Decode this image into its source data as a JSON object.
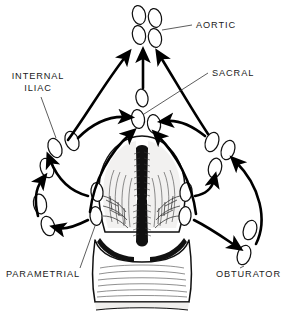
{
  "figure": {
    "background_color": "#ffffff",
    "ink_color": "#111111",
    "width": 284,
    "height": 318
  },
  "labels": [
    {
      "id": "aortic",
      "text": "AORTIC",
      "x": 196,
      "y": 28,
      "anchor": "start"
    },
    {
      "id": "sacral",
      "text": "SACRAL",
      "x": 212,
      "y": 76,
      "anchor": "start"
    },
    {
      "id": "internal",
      "text": "INTERNAL",
      "x": 38,
      "y": 79,
      "anchor": "middle"
    },
    {
      "id": "iliac",
      "text": "ILIAC",
      "x": 38,
      "y": 91,
      "anchor": "middle"
    },
    {
      "id": "parametrial",
      "text": "PARAMETRIAL",
      "x": 6,
      "y": 277,
      "anchor": "start"
    },
    {
      "id": "obturator",
      "text": "OBTURATOR",
      "x": 216,
      "y": 277,
      "anchor": "start"
    }
  ],
  "node_groups": [
    {
      "name": "aortic-nodes",
      "label": "AORTIC",
      "nodes": [
        {
          "cx": 139,
          "cy": 15,
          "rx": 6.5,
          "ry": 9.5,
          "rot": -12
        },
        {
          "cx": 155,
          "cy": 18,
          "rx": 6.5,
          "ry": 9.5,
          "rot": -12
        },
        {
          "cx": 139,
          "cy": 35,
          "rx": 6.5,
          "ry": 9.5,
          "rot": -12
        },
        {
          "cx": 155,
          "cy": 38,
          "rx": 6.5,
          "ry": 9.5,
          "rot": -12
        }
      ]
    },
    {
      "name": "sacral-nodes",
      "label": "SACRAL",
      "nodes": [
        {
          "cx": 142,
          "cy": 98,
          "rx": 6,
          "ry": 9,
          "rot": -10
        },
        {
          "cx": 138,
          "cy": 119,
          "rx": 6.5,
          "ry": 9.5,
          "rot": -10
        },
        {
          "cx": 154,
          "cy": 124,
          "rx": 6.5,
          "ry": 9.5,
          "rot": -10
        }
      ]
    },
    {
      "name": "internal-iliac-nodes-left",
      "label": "INTERNAL ILIAC",
      "nodes": [
        {
          "cx": 55,
          "cy": 148,
          "rx": 6.5,
          "ry": 10,
          "rot": -22
        },
        {
          "cx": 72,
          "cy": 141,
          "rx": 6.5,
          "ry": 10,
          "rot": -22
        },
        {
          "cx": 47,
          "cy": 168,
          "rx": 6.5,
          "ry": 10,
          "rot": -18
        },
        {
          "cx": 40,
          "cy": 204,
          "rx": 6.5,
          "ry": 10,
          "rot": -10
        },
        {
          "cx": 48,
          "cy": 226,
          "rx": 6.5,
          "ry": 10,
          "rot": -18
        }
      ]
    },
    {
      "name": "iliac-nodes-right",
      "label": "RIGHT ILIAC CHAIN",
      "nodes": [
        {
          "cx": 212,
          "cy": 142,
          "rx": 6.5,
          "ry": 10,
          "rot": 20
        },
        {
          "cx": 228,
          "cy": 150,
          "rx": 6.5,
          "ry": 10,
          "rot": 20
        },
        {
          "cx": 215,
          "cy": 168,
          "rx": 6.5,
          "ry": 10,
          "rot": 14
        }
      ]
    },
    {
      "name": "parametrial-nodes",
      "label": "PARAMETRIAL",
      "nodes": [
        {
          "cx": 97,
          "cy": 192,
          "rx": 6,
          "ry": 9.5,
          "rot": -6
        },
        {
          "cx": 96,
          "cy": 216,
          "rx": 6,
          "ry": 9.5,
          "rot": -6
        },
        {
          "cx": 186,
          "cy": 192,
          "rx": 6,
          "ry": 9.5,
          "rot": 6
        },
        {
          "cx": 185,
          "cy": 216,
          "rx": 6,
          "ry": 9.5,
          "rot": 6
        }
      ]
    },
    {
      "name": "obturator-nodes",
      "label": "OBTURATOR",
      "nodes": [
        {
          "cx": 250,
          "cy": 230,
          "rx": 6.5,
          "ry": 10,
          "rot": 18
        },
        {
          "cx": 244,
          "cy": 255,
          "rx": 6.5,
          "ry": 10,
          "rot": 18
        }
      ]
    }
  ],
  "flows": [
    {
      "from": "internal-iliac-left",
      "to": "aortic",
      "direction": "up-right"
    },
    {
      "from": "sacral",
      "to": "aortic",
      "direction": "up"
    },
    {
      "from": "iliac-right",
      "to": "aortic",
      "direction": "up-left"
    },
    {
      "from": "parametrial-left",
      "to": "sacral",
      "direction": "right"
    },
    {
      "from": "parametrial-right",
      "to": "sacral",
      "direction": "left"
    },
    {
      "from": "cervix-left",
      "to": "sacral",
      "direction": "up-right"
    },
    {
      "from": "cervix-right",
      "to": "sacral",
      "direction": "up-left"
    },
    {
      "from": "parametrial-left",
      "to": "internal-iliac-left",
      "direction": "up-left"
    },
    {
      "from": "parametrial-left",
      "to": "obturator-left",
      "direction": "down-left"
    },
    {
      "from": "parametrial-right",
      "to": "iliac-right",
      "direction": "up-right"
    },
    {
      "from": "parametrial-right",
      "to": "obturator-right",
      "direction": "down-right"
    },
    {
      "from": "obturator-right",
      "to": "iliac-right",
      "direction": "up"
    }
  ],
  "anatomy": {
    "name": "uterus-cervix-vagina-coronal-section",
    "parts": [
      "uterine fundus",
      "endometrial cavity",
      "cervical canal",
      "vaginal fornix",
      "vaginal canal",
      "vaginal rugae"
    ]
  }
}
